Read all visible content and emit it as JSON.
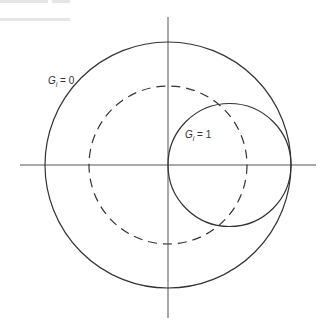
{
  "diagram": {
    "type": "smith-chart-conductance-circles",
    "colors": {
      "stroke": "#333333",
      "axis": "#555555",
      "background": "#ffffff"
    },
    "axes": {
      "horizontal": {
        "x1": 20,
        "x2": 316,
        "y": 165
      },
      "vertical": {
        "x": 168,
        "y1": 17,
        "y2": 318
      }
    },
    "circles": [
      {
        "name": "outer-unit-circle",
        "cx": 168,
        "cy": 165,
        "r": 123,
        "style": "solid"
      },
      {
        "name": "g1-circle",
        "cx": 229.5,
        "cy": 165,
        "r": 61.5,
        "style": "solid"
      },
      {
        "name": "dashed-circle",
        "cx": 168,
        "cy": 165,
        "r": 79,
        "style": "dashed"
      }
    ],
    "labels": {
      "g0": {
        "symbol": "G",
        "subscript": "i",
        "rest": " = 0",
        "x": 48,
        "y": 84
      },
      "g1": {
        "symbol": "G",
        "subscript": "i",
        "rest": " = 1",
        "x": 185,
        "y": 138
      }
    }
  }
}
